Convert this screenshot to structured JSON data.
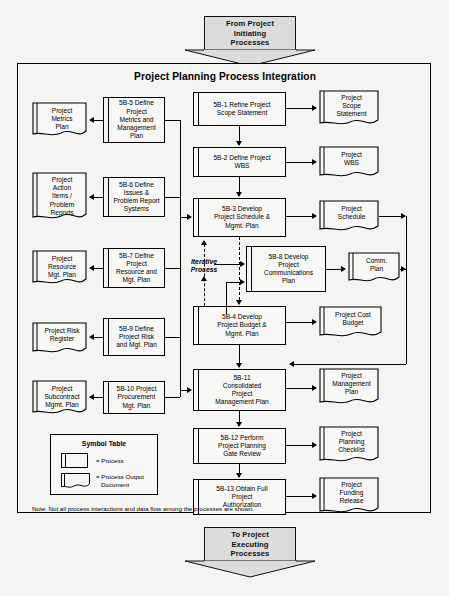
{
  "diagram": {
    "title": "Project Planning Process Integration",
    "note": "Note: Not all process interactions and data flow among the processes are shown.",
    "iterative_label_line1": "Iterative",
    "iterative_label_line2": "Process",
    "top_banner": {
      "name": "from-project-initiating-processes",
      "line1": "From Project",
      "line2": "Initiating",
      "line3": "Processes"
    },
    "bottom_banner": {
      "name": "to-project-executing-processes",
      "line1": "To Project",
      "line2": "Executing",
      "line3": "Processes"
    },
    "legend": {
      "title": "Symbol Table",
      "process_label": "= Process",
      "document_label_line1": "= Process Output",
      "document_label_line2": "Document"
    },
    "center_processes": [
      {
        "id": "5B-1",
        "l1": "5B-1 Refine Project",
        "l2": "Scope Statement",
        "l3": "",
        "l4": ""
      },
      {
        "id": "5B-2",
        "l1": "5B-2 Define Project",
        "l2": "WBS",
        "l3": "",
        "l4": ""
      },
      {
        "id": "5B-3",
        "l1": "5B-3 Develop",
        "l2": "Project Schedule &",
        "l3": "Mgmt. Plan",
        "l4": ""
      },
      {
        "id": "5B-4",
        "l1": "5B-4 Develop",
        "l2": "Project Budget &",
        "l3": "Mgmt. Plan",
        "l4": ""
      },
      {
        "id": "5B-11",
        "l1": "5B-11",
        "l2": "Consolidated",
        "l3": "Project",
        "l4": "Management Plan"
      },
      {
        "id": "5B-12",
        "l1": "5B-12 Perform",
        "l2": "Project Planning",
        "l3": "Gate Review",
        "l4": ""
      },
      {
        "id": "5B-13",
        "l1": "5B-13 Obtain Full",
        "l2": "Project",
        "l3": "Authorization",
        "l4": ""
      }
    ],
    "center_outputs": [
      {
        "id": "project-scope-statement",
        "l1": "Project",
        "l2": "Scope",
        "l3": "Statement"
      },
      {
        "id": "project-wbs",
        "l1": "Project",
        "l2": "WBS",
        "l3": ""
      },
      {
        "id": "project-schedule",
        "l1": "Project",
        "l2": "Schedule",
        "l3": ""
      },
      {
        "id": "project-cost-budget",
        "l1": "Project Cost",
        "l2": "Budget",
        "l3": ""
      },
      {
        "id": "project-management-plan",
        "l1": "Project",
        "l2": "Management",
        "l3": "Plan"
      },
      {
        "id": "project-planning-checklist",
        "l1": "Project",
        "l2": "Planning",
        "l3": "Checklist"
      },
      {
        "id": "project-funding-release",
        "l1": "Project",
        "l2": "Funding",
        "l3": "Release"
      }
    ],
    "comm_process": {
      "id": "5B-8",
      "l1": "5B-8 Develop",
      "l2": "Project",
      "l3": "Communications",
      "l4": "Plan"
    },
    "comm_output": {
      "id": "comm-plan",
      "l1": "Comm.",
      "l2": "Plan",
      "l3": ""
    },
    "left_processes": [
      {
        "id": "5B-5",
        "l1": "5B-5 Define",
        "l2": "Project",
        "l3": "Metrics and",
        "l4": "Management",
        "l5": "Plan"
      },
      {
        "id": "5B-6",
        "l1": "5B-6 Define",
        "l2": "Issues &",
        "l3": "Problem Report",
        "l4": "Systems",
        "l5": ""
      },
      {
        "id": "5B-7",
        "l1": "5B-7 Define",
        "l2": "Project",
        "l3": "Resource and",
        "l4": "Mgt. Plan",
        "l5": ""
      },
      {
        "id": "5B-9",
        "l1": "5B-9 Define",
        "l2": "Project Risk",
        "l3": "and Mgt. Plan",
        "l4": "",
        "l5": ""
      },
      {
        "id": "5B-10",
        "l1": "5B-10 Project",
        "l2": "Procurement",
        "l3": "Mgt. Plan",
        "l4": "",
        "l5": ""
      }
    ],
    "left_outputs": [
      {
        "id": "project-metrics-plan",
        "l1": "Project",
        "l2": "Metrics",
        "l3": "Plan",
        "l4": "",
        "l5": ""
      },
      {
        "id": "project-action-items",
        "l1": "Project",
        "l2": "Action",
        "l3": "Items /",
        "l4": "Problem",
        "l5": "Reports"
      },
      {
        "id": "project-resource-mgt-plan",
        "l1": "Project",
        "l2": "Resource",
        "l3": "Mgt. Plan",
        "l4": "",
        "l5": ""
      },
      {
        "id": "project-risk-register",
        "l1": "Project Risk",
        "l2": "Register",
        "l3": "",
        "l4": "",
        "l5": ""
      },
      {
        "id": "project-subcontract-mgmt-plan",
        "l1": "Project",
        "l2": "Subcontract",
        "l3": "Mgmt. Plan",
        "l4": "",
        "l5": ""
      }
    ]
  }
}
